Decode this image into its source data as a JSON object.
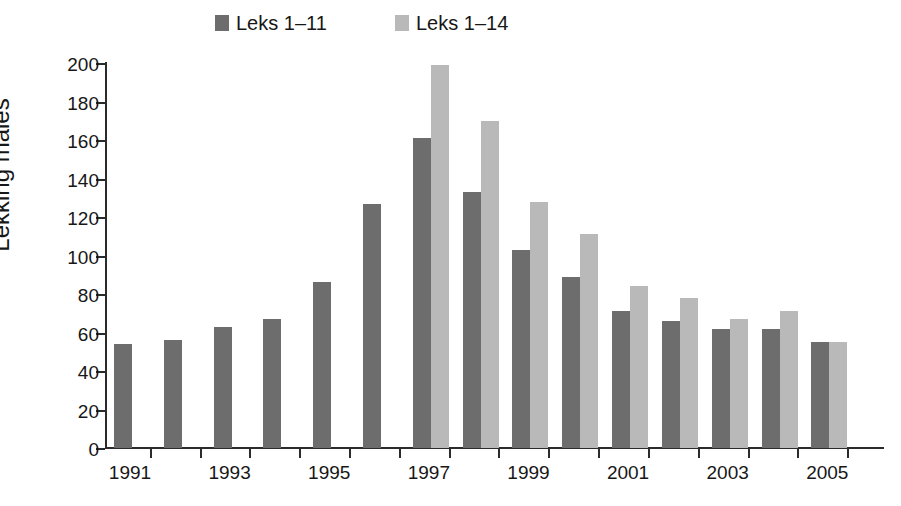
{
  "chart_data": {
    "type": "bar",
    "title": "",
    "xlabel": "",
    "ylabel": "Lekking males",
    "ylim": [
      0,
      200
    ],
    "ytick_step": 20,
    "yticks": [
      0,
      20,
      40,
      60,
      80,
      100,
      120,
      140,
      160,
      180,
      200
    ],
    "grid": false,
    "legend_position": "top-center",
    "categories": [
      "1991",
      "1992",
      "1993",
      "1994",
      "1995",
      "1996",
      "1997",
      "1998",
      "1999",
      "2000",
      "2001",
      "2002",
      "2003",
      "2004",
      "2005"
    ],
    "xtick_labels_shown": [
      "1991",
      "1993",
      "1995",
      "1997",
      "1999",
      "2001",
      "2003",
      "2005"
    ],
    "series": [
      {
        "name": "Leks 1–11",
        "color": "#6d6d6d",
        "values": [
          54,
          56,
          63,
          67,
          86,
          127,
          161,
          133,
          103,
          89,
          71,
          66,
          62,
          62,
          55
        ]
      },
      {
        "name": "Leks 1–14",
        "color": "#b9b9b9",
        "values": [
          null,
          null,
          null,
          null,
          null,
          null,
          199,
          170,
          128,
          111,
          84,
          78,
          67,
          71,
          55
        ]
      }
    ]
  },
  "legend": {
    "items": [
      {
        "label": "Leks 1–11",
        "color": "#6d6d6d"
      },
      {
        "label": "Leks 1–14",
        "color": "#b9b9b9"
      }
    ]
  },
  "axes": {
    "y_axis_title": "Lekking males",
    "y_tick_labels": [
      "200",
      "180",
      "160",
      "140",
      "120",
      "100",
      "80",
      "60",
      "40",
      "20",
      "0"
    ],
    "x_tick_labels": [
      "1991",
      "1993",
      "1995",
      "1997",
      "1999",
      "2001",
      "2003",
      "2005"
    ]
  }
}
